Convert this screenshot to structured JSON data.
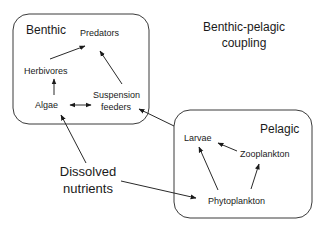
{
  "diagram": {
    "title": {
      "line1": "Benthic-pelagic",
      "line2": "coupling"
    },
    "benthic": {
      "label": "Benthic",
      "nodes": {
        "predators": "Predators",
        "herbivores": "Herbivores",
        "algae": "Algae",
        "suspension_feeders_1": "Suspension",
        "suspension_feeders_2": "feeders"
      }
    },
    "pelagic": {
      "label": "Pelagic",
      "nodes": {
        "larvae": "Larvae",
        "zooplankton": "Zooplankton",
        "phytoplankton": "Phytoplankton"
      }
    },
    "external": {
      "dissolved_nutrients_1": "Dissolved",
      "dissolved_nutrients_2": "nutrients"
    },
    "edges": [
      {
        "from": "Herbivores",
        "to": "Predators"
      },
      {
        "from": "Suspension feeders",
        "to": "Predators"
      },
      {
        "from": "Algae",
        "to": "Herbivores"
      },
      {
        "from": "Algae",
        "to": "Suspension feeders",
        "bidirectional": true
      },
      {
        "from": "Dissolved nutrients",
        "to": "Algae"
      },
      {
        "from": "Dissolved nutrients",
        "to": "Phytoplankton"
      },
      {
        "from": "Pelagic",
        "to": "Suspension feeders"
      },
      {
        "from": "Phytoplankton",
        "to": "Larvae"
      },
      {
        "from": "Phytoplankton",
        "to": "Zooplankton"
      },
      {
        "from": "Zooplankton",
        "to": "Larvae"
      }
    ]
  }
}
